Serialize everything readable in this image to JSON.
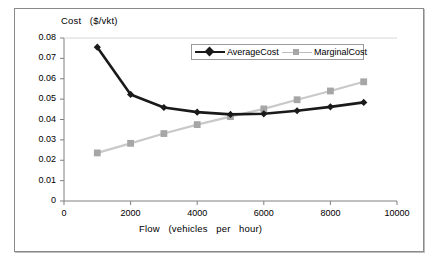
{
  "chart_data": {
    "type": "line",
    "title": "",
    "ylabel": "Cost   ($/vkt)",
    "xlabel": "Flow   (vehicles   per   hour)",
    "x": [
      1000,
      2000,
      3000,
      4000,
      5000,
      6000,
      7000,
      8000,
      9000
    ],
    "xlim": [
      0,
      10000
    ],
    "ylim": [
      0,
      0.08
    ],
    "xticks": [
      "0",
      "2000",
      "4000",
      "6000",
      "8000",
      "10000"
    ],
    "xtick_values": [
      0,
      2000,
      4000,
      6000,
      8000,
      10000
    ],
    "yticks": [
      "0",
      "0.01",
      "0.02",
      "0.03",
      "0.04",
      "0.05",
      "0.06",
      "0.07",
      "0.08"
    ],
    "ytick_values": [
      0,
      0.01,
      0.02,
      0.03,
      0.04,
      0.05,
      0.06,
      0.07,
      0.08
    ],
    "grid": false,
    "legend_position": "top-right-inside",
    "series": [
      {
        "name": "AverageCost",
        "color": "#1a1a1a",
        "marker": "diamond",
        "values": [
          0.0755,
          0.0523,
          0.0459,
          0.0436,
          0.0425,
          0.0428,
          0.0443,
          0.0462,
          0.0484
        ]
      },
      {
        "name": "MarginalCost",
        "color": "#a6a6a6",
        "marker": "square",
        "values": [
          0.0236,
          0.0283,
          0.0331,
          0.0375,
          0.0414,
          0.0452,
          0.0497,
          0.054,
          0.0585
        ]
      }
    ]
  },
  "legend": {
    "entries": [
      {
        "label": "AverageCost"
      },
      {
        "label": "MarginalCost"
      }
    ]
  },
  "colors": {
    "average_cost": "#1a1a1a",
    "marginal_cost": "#a6a6a6",
    "axis": "#808080",
    "frame": "#8a8a8a",
    "background": "#ffffff"
  }
}
